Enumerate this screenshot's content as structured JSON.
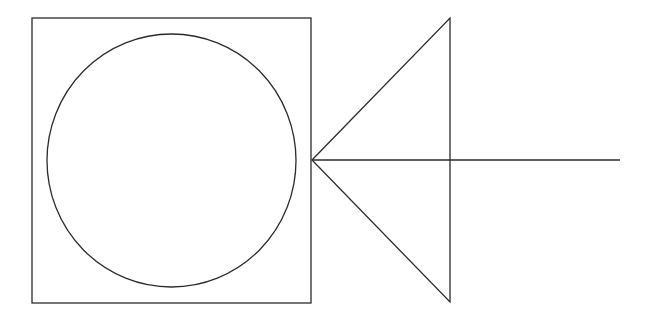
{
  "canvas": {
    "width": 655,
    "height": 322,
    "background": "#ffffff"
  },
  "stroke": {
    "color": "#2b2b2b",
    "width": 1.3
  },
  "shapes": {
    "square": {
      "x": 32,
      "y": 18,
      "width": 279,
      "height": 285
    },
    "circle": {
      "cx": 171.5,
      "cy": 160.5,
      "rx": 124.5,
      "ry": 126.5
    },
    "triangle": {
      "points": [
        [
          312,
          160
        ],
        [
          450,
          18
        ],
        [
          450,
          302
        ]
      ]
    },
    "axis_line": {
      "x1": 312,
      "y1": 160,
      "x2": 620,
      "y2": 160
    }
  }
}
